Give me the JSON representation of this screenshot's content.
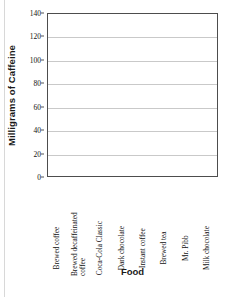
{
  "chart_data": {
    "type": "bar",
    "title": "",
    "xlabel": "Food",
    "ylabel": "Milligrams of Caffeine",
    "categories": [
      "Brewed coffee",
      "Brewed decaffeinated coffee",
      "Coca-Cola Classic",
      "Dark chocolate",
      "Instant coffee",
      "Brewed tea",
      "Mr. Pibb",
      "Milk chocolate"
    ],
    "values": [
      null,
      null,
      null,
      null,
      null,
      null,
      null,
      null
    ],
    "ylim": [
      0,
      140
    ],
    "yticks": [
      0,
      20,
      40,
      60,
      80,
      100,
      120,
      140
    ],
    "ytick_labels": [
      "0",
      "20",
      "40",
      "60",
      "80",
      "100",
      "120",
      "140"
    ],
    "grid": true,
    "legend": false,
    "note": "empty plot area - no bars drawn"
  },
  "axes": {
    "y_title": "Milligrams of Caffeine",
    "x_title": "Food"
  },
  "colors": {
    "background": "#ffffff",
    "plot_border": "#4d4d4d",
    "gridline": "#c9c9c9",
    "text": "#111111",
    "axis_title": "#1a1a1a"
  },
  "x_label_lines": [
    [
      "Brewed coffee"
    ],
    [
      "Brewed decaffeinated",
      "coffee"
    ],
    [
      "Coca-Cola Classic"
    ],
    [
      "Dark chocolate"
    ],
    [
      "Instant coffee"
    ],
    [
      "Brewed tea"
    ],
    [
      "Mr. Pibb"
    ],
    [
      "Milk chocolate"
    ]
  ]
}
